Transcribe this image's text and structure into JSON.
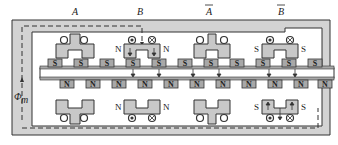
{
  "diagram": {
    "type": "linear hybrid stepper motor cross-section",
    "phase_labels": [
      {
        "id": "A",
        "text": "A",
        "overline": false,
        "x": 75
      },
      {
        "id": "B",
        "text": "B",
        "overline": false,
        "x": 140
      },
      {
        "id": "A_bar",
        "text": "A",
        "overline": true,
        "x": 209
      },
      {
        "id": "B_bar",
        "text": "B",
        "overline": true,
        "x": 281
      }
    ],
    "flux_label": {
      "symbol": "Φ",
      "subscript": "m"
    },
    "stator_pole_labels": [
      {
        "text": "N",
        "x": 115,
        "y": 48
      },
      {
        "text": "N",
        "x": 165,
        "y": 48
      },
      {
        "text": "S",
        "x": 258,
        "y": 48
      },
      {
        "text": "S",
        "x": 303,
        "y": 48
      },
      {
        "text": "N",
        "x": 115,
        "y": 112
      },
      {
        "text": "N",
        "x": 165,
        "y": 112
      },
      {
        "text": "S",
        "x": 258,
        "y": 112
      },
      {
        "text": "S",
        "x": 303,
        "y": 112
      }
    ],
    "mover_top_teeth": [
      "S",
      "S",
      "S",
      "S",
      "S",
      "S",
      "S",
      "S",
      "S",
      "S",
      "S",
      "S"
    ],
    "mover_bottom_teeth": [
      "N",
      "N",
      "N",
      "N",
      "N",
      "N",
      "N",
      "N",
      "N",
      "N",
      "N",
      "N"
    ],
    "colors": {
      "yoke_fill": "#d3d3d3",
      "tooth_fill": "#a8a8a8",
      "outline": "#333333",
      "background": "#ffffff"
    }
  }
}
